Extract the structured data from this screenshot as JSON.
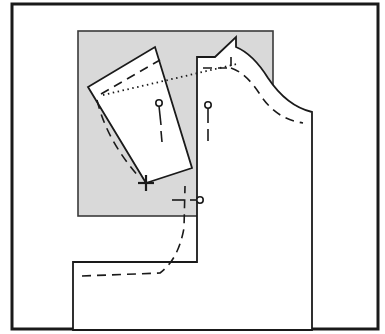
{
  "figure": {
    "kind": "sewing-pattern-diagram",
    "canvas": {
      "width": 385,
      "height": 334
    },
    "colors": {
      "background": "#ffffff",
      "ink": "#1a1a1a",
      "frame": "#1a1a1a",
      "shaded_block_fill": "#d9d9d9",
      "shaded_block_stroke": "#3a3a3a",
      "piece_fill": "#ffffff"
    },
    "frame": {
      "name": "border-frame",
      "x": 12,
      "y": 4,
      "width": 366,
      "height": 325,
      "stroke_width": 3
    },
    "shaded_block": {
      "name": "shaded-background-block",
      "x": 78,
      "y": 31,
      "width": 195,
      "height": 185,
      "fill": "#d9d9d9",
      "stroke_width": 1.6
    },
    "main_piece": {
      "name": "bodice-front-piece",
      "description": "Main pattern body with neckline, shoulder and armhole curve",
      "outline_path": "M 197,57 L 197,262 L 73,262 L 73,330 L 312,330 L 312,112 C 295,108 280,96 268,78 C 258,62 248,52 236,47 L 236,37 L 215,57 Z",
      "stroke_width": 1.8
    },
    "seam_allowance_dashes": {
      "name": "seam-allowance-stitch-lines",
      "stroke_width": 1.6,
      "dash_pattern": "9 6",
      "paths": [
        "M 203,68 L 231,68 L 231,55",
        "M 231,68 C 243,72 252,82 261,96 C 272,112 285,120 303,123",
        "M 82,276 L 160,273 C 172,264 180,250 184,228 L 185,186"
      ]
    },
    "rotated_piece": {
      "name": "rotated-dart-section",
      "description": "Pattern section pivoted about the marked point",
      "outline_path": "M 146,183 L 88,87 L 155,47 L 192,168 Z",
      "stroke_width": 1.8,
      "inner_dashes": {
        "name": "rotated-piece-stitch-line",
        "dash_pattern": "9 6",
        "paths": [
          "M 101,94 L 160,60",
          "M 97,100 C 104,128 117,152 140,178"
        ]
      }
    },
    "pivot_mark": {
      "name": "pivot-point-cross",
      "x": 146,
      "y": 183,
      "arm": 8,
      "stroke_width": 2.2
    },
    "rotation_guide": {
      "name": "rotation-dotted-guide-line",
      "from": {
        "x": 103,
        "y": 95
      },
      "to": {
        "x": 237,
        "y": 64
      },
      "dash_pattern": "1.5 3.5",
      "stroke_width": 1.8
    },
    "notch_markers": [
      {
        "name": "notch-marker-rotated-piece",
        "circle": {
          "x": 159,
          "y": 103,
          "r": 3.2
        },
        "stem": "M 159,106 L 161,125",
        "tick": "M 161,131 L 162,142",
        "stroke_width": 1.6
      },
      {
        "name": "notch-marker-main-piece",
        "circle": {
          "x": 208,
          "y": 105,
          "r": 3.2
        },
        "stem": "M 208,108 L 208,123",
        "tick": "M 208,129 L 208,141",
        "stroke_width": 1.6
      }
    ],
    "horizontal_marker": {
      "name": "grainline-dash-marker",
      "dash_segment": "M 172,200 L 184,200",
      "lead_segment": "M 190,200 L 196,200",
      "circle": {
        "x": 200,
        "y": 200,
        "r": 3.2
      },
      "stroke_width": 1.6
    },
    "labels": []
  }
}
